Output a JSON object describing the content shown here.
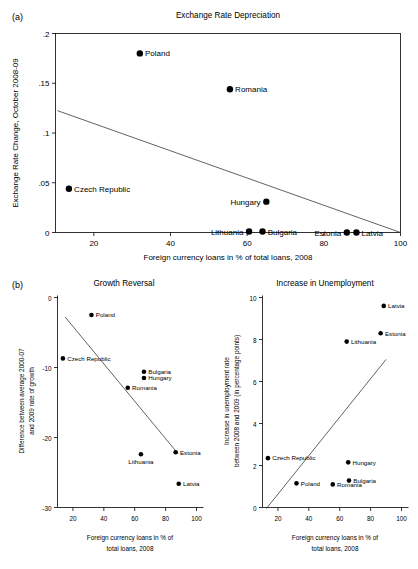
{
  "figure": {
    "panel_a_letter": "(a)",
    "panel_b_letter": "(b)",
    "caption": ""
  },
  "chart_data": [
    {
      "id": "exchange-rate-depreciation",
      "type": "scatter",
      "title": "Exchange Rate Depreciation",
      "xlabel": "Foreign currency loans in % of total loans, 2008",
      "ylabel": "Exchange Rate Change, October 2008-09",
      "xlim": [
        10,
        100
      ],
      "ylim": [
        0,
        0.2
      ],
      "xticks": [
        20,
        40,
        60,
        80,
        100
      ],
      "xticklabels": [
        "20",
        "40",
        "60",
        "80",
        "100"
      ],
      "yticks": [
        0,
        0.05,
        0.1,
        0.15,
        0.2
      ],
      "yticklabels": [
        "0",
        ".05",
        ".1",
        ".15",
        ".2"
      ],
      "grid": false,
      "legend": "none",
      "frame": "box",
      "points": [
        {
          "name": "Poland",
          "x": 32.0,
          "y": 0.18,
          "label_side": "right"
        },
        {
          "name": "Romania",
          "x": 55.5,
          "y": 0.144,
          "label_side": "right"
        },
        {
          "name": "Czech Republic",
          "x": 13.5,
          "y": 0.044,
          "label_side": "right"
        },
        {
          "name": "Hungary",
          "x": 65.0,
          "y": 0.031,
          "label_side": "left"
        },
        {
          "name": "Lithuania",
          "x": 60.5,
          "y": 0.001,
          "label_side": "left"
        },
        {
          "name": "Bulgaria",
          "x": 64.0,
          "y": 0.001,
          "label_side": "right"
        },
        {
          "name": "Estonia",
          "x": 86.0,
          "y": 0.0,
          "label_side": "left"
        },
        {
          "name": "Latvia",
          "x": 88.5,
          "y": 0.0,
          "label_side": "right"
        }
      ],
      "fit_line": {
        "x1": 10.5,
        "y1": 0.1225,
        "x2": 100.0,
        "y2": 0.0
      }
    },
    {
      "id": "growth-reversal",
      "type": "scatter",
      "title": "Growth Reversal",
      "xlabel": "Foreign currency loans in % of total loans, 2008",
      "ylabel": "Difference between average 2000-07 and 2009 rate of growth",
      "xlim": [
        10,
        100
      ],
      "ylim": [
        -30,
        0
      ],
      "xticks": [
        20,
        40,
        60,
        80,
        100
      ],
      "xticklabels": [
        "20",
        "40",
        "60",
        "80",
        "100"
      ],
      "yticks": [
        -30,
        -20,
        -10,
        0
      ],
      "yticklabels": [
        "-30",
        "-20",
        "-10",
        "0"
      ],
      "grid": false,
      "legend": "none",
      "frame": "left-bottom",
      "points": [
        {
          "name": "Poland",
          "x": 32.0,
          "y": -2.5,
          "label_side": "right"
        },
        {
          "name": "Czech Republic",
          "x": 13.5,
          "y": -8.7,
          "label_side": "right"
        },
        {
          "name": "Bulgaria",
          "x": 66.0,
          "y": -10.6,
          "label_side": "right"
        },
        {
          "name": "Hungary",
          "x": 66.0,
          "y": -11.5,
          "label_side": "right"
        },
        {
          "name": "Romania",
          "x": 55.5,
          "y": -12.9,
          "label_side": "right"
        },
        {
          "name": "Estonia",
          "x": 86.5,
          "y": -22.1,
          "label_side": "right"
        },
        {
          "name": "Lithuania",
          "x": 64.0,
          "y": -22.4,
          "label_side": "below"
        },
        {
          "name": "Latvia",
          "x": 88.5,
          "y": -26.6,
          "label_side": "right"
        }
      ],
      "fit_line": {
        "x1": 15.0,
        "y1": -2.8,
        "x2": 88.0,
        "y2": -22.3
      }
    },
    {
      "id": "increase-in-unemployment",
      "type": "scatter",
      "title": "Increase in Unemployment",
      "xlabel": "Foreign currency loans in % of total loans, 2008",
      "ylabel": "Increase in unemployment rate between 2008 and 2009 (in percentage points)",
      "xlim": [
        10,
        100
      ],
      "ylim": [
        0,
        10
      ],
      "xticks": [
        20,
        40,
        60,
        80,
        100
      ],
      "xticklabels": [
        "20",
        "40",
        "60",
        "80",
        "100"
      ],
      "yticks": [
        0,
        2,
        4,
        6,
        8,
        10
      ],
      "yticklabels": [
        "0",
        "2",
        "4",
        "6",
        "8",
        "10"
      ],
      "grid": false,
      "legend": "none",
      "frame": "left-bottom",
      "points": [
        {
          "name": "Latvia",
          "x": 88.5,
          "y": 9.6,
          "label_side": "right"
        },
        {
          "name": "Estonia",
          "x": 86.5,
          "y": 8.3,
          "label_side": "right"
        },
        {
          "name": "Lithuania",
          "x": 64.5,
          "y": 7.9,
          "label_side": "right"
        },
        {
          "name": "Czech Republic",
          "x": 13.5,
          "y": 2.35,
          "label_side": "right"
        },
        {
          "name": "Hungary",
          "x": 65.5,
          "y": 2.15,
          "label_side": "right"
        },
        {
          "name": "Bulgaria",
          "x": 66.0,
          "y": 1.28,
          "label_side": "right"
        },
        {
          "name": "Poland",
          "x": 32.0,
          "y": 1.15,
          "label_side": "right"
        },
        {
          "name": "Romania",
          "x": 55.5,
          "y": 1.1,
          "label_side": "right"
        }
      ],
      "fit_line": {
        "x1": 12.5,
        "y1": -0.05,
        "x2": 90.0,
        "y2": 7.05
      }
    }
  ]
}
